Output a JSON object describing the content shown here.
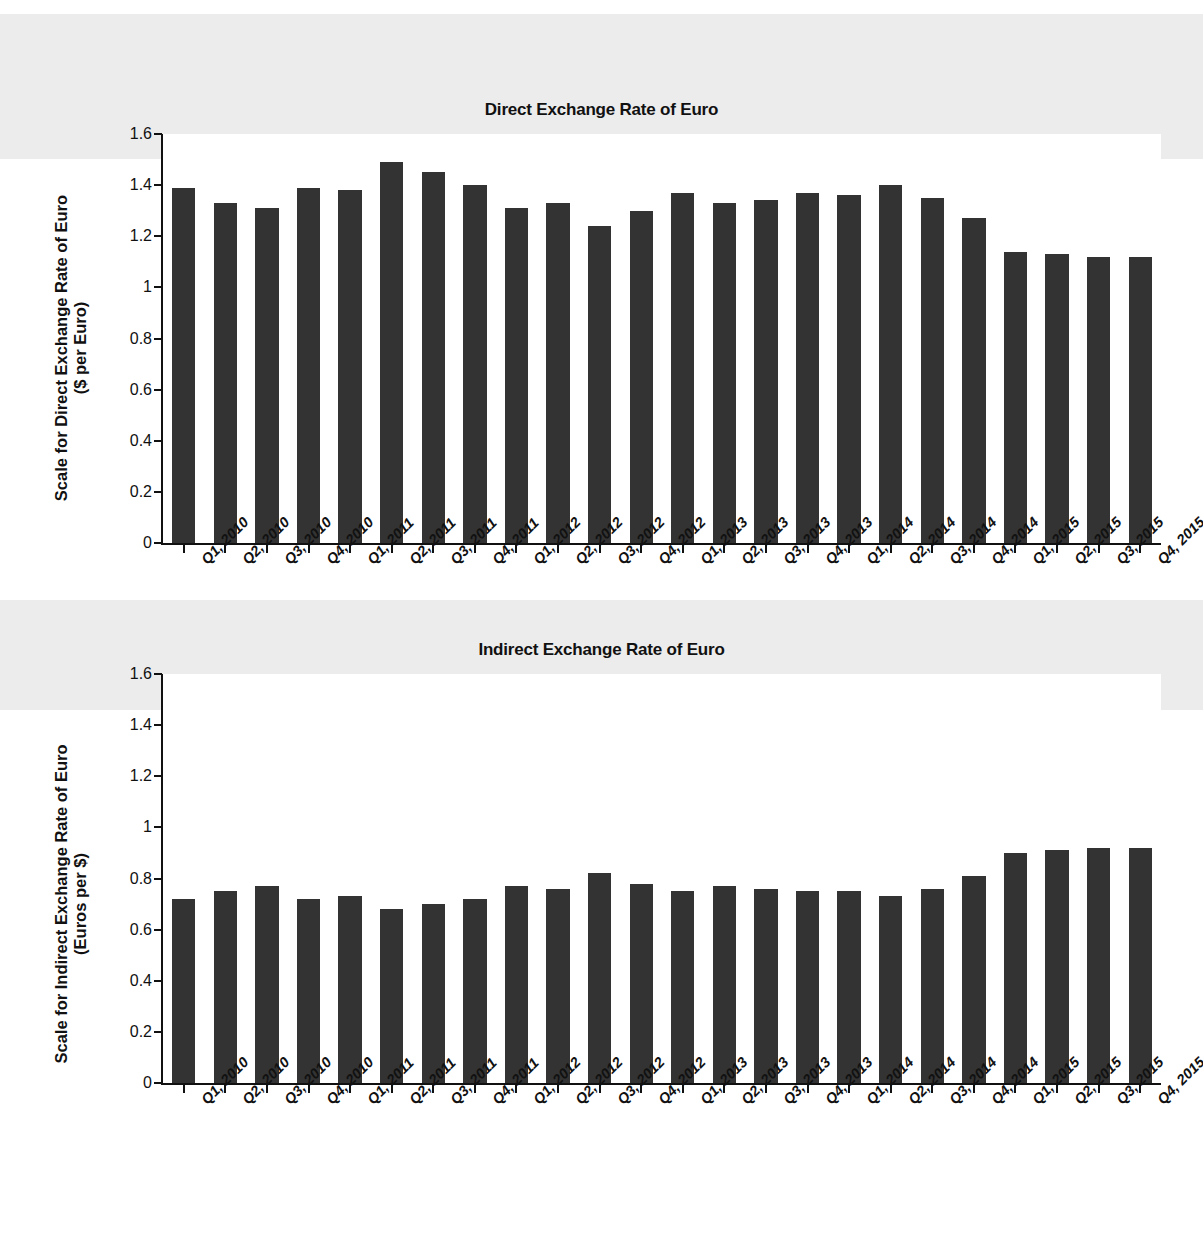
{
  "page": {
    "background_color": "#ffffff",
    "bar_color": "#333333",
    "axis_color": "#111111"
  },
  "chart_data": [
    {
      "type": "bar",
      "id": "direct",
      "title": "Direct Exchange Rate of Euro",
      "xlabel": "",
      "ylabel": "Scale for Direct Exchange Rate of Euro\n($ per Euro)",
      "ylim": [
        0,
        1.6
      ],
      "yticks": [
        0,
        0.2,
        0.4,
        0.6,
        0.8,
        1,
        1.2,
        1.4,
        1.6
      ],
      "ytick_labels": [
        "0",
        "0.2",
        "0.4",
        "0.6",
        "0.8",
        "1",
        "1.2",
        "1.4",
        "1.6"
      ],
      "grid": false,
      "legend": "none",
      "categories": [
        "Q1, 2010",
        "Q2, 2010",
        "Q3, 2010",
        "Q4, 2010",
        "Q1, 2011",
        "Q2, 2011",
        "Q3, 2011",
        "Q4, 2011",
        "Q1, 2012",
        "Q2, 2012",
        "Q3, 2012",
        "Q4, 2012",
        "Q1, 2013",
        "Q2, 2013",
        "Q3, 2013",
        "Q4, 2013",
        "Q1, 2014",
        "Q2, 2014",
        "Q3, 2014",
        "Q4, 2014",
        "Q1, 2015",
        "Q2, 2015",
        "Q3, 2015",
        "Q4, 2015"
      ],
      "values": [
        1.39,
        1.33,
        1.31,
        1.39,
        1.38,
        1.49,
        1.45,
        1.4,
        1.31,
        1.33,
        1.24,
        1.3,
        1.37,
        1.33,
        1.34,
        1.37,
        1.36,
        1.4,
        1.35,
        1.27,
        1.14,
        1.13,
        1.12,
        1.12
      ]
    },
    {
      "type": "bar",
      "id": "indirect",
      "title": "Indirect Exchange Rate of Euro",
      "xlabel": "",
      "ylabel": "Scale for Indirect Exchange Rate of Euro\n(Euros per $)",
      "ylim": [
        0,
        1.6
      ],
      "yticks": [
        0,
        0.2,
        0.4,
        0.6,
        0.8,
        1,
        1.2,
        1.4,
        1.6
      ],
      "ytick_labels": [
        "0",
        "0.2",
        "0.4",
        "0.6",
        "0.8",
        "1",
        "1.2",
        "1.4",
        "1.6"
      ],
      "grid": false,
      "legend": "none",
      "categories": [
        "Q1, 2010",
        "Q2, 2010",
        "Q3, 2010",
        "Q4, 2010",
        "Q1, 2011",
        "Q2, 2011",
        "Q3, 2011",
        "Q4, 2011",
        "Q1, 2012",
        "Q2, 2012",
        "Q3, 2012",
        "Q4, 2012",
        "Q1, 2013",
        "Q2, 2013",
        "Q3, 2013",
        "Q4, 2013",
        "Q1, 2014",
        "Q2, 2014",
        "Q3, 2014",
        "Q4, 2014",
        "Q1, 2015",
        "Q2, 2015",
        "Q3, 2015",
        "Q4, 2015"
      ],
      "values": [
        0.72,
        0.75,
        0.77,
        0.72,
        0.73,
        0.68,
        0.7,
        0.72,
        0.77,
        0.76,
        0.82,
        0.78,
        0.75,
        0.77,
        0.76,
        0.75,
        0.75,
        0.73,
        0.76,
        0.81,
        0.9,
        0.91,
        0.92,
        0.92
      ]
    }
  ]
}
